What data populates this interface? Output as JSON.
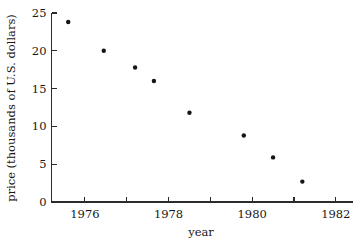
{
  "chart_data": {
    "type": "scatter",
    "title": "",
    "xlabel": "year",
    "ylabel": "price (thousands of U.S. dollars)",
    "xlim": [
      1975.2,
      1982.4
    ],
    "ylim": [
      0,
      25
    ],
    "grid": false,
    "legend": null,
    "marker": {
      "shape": "circle",
      "color": "#16161a",
      "size_px": 4.4
    },
    "xticks": [
      1976,
      1977,
      1978,
      1979,
      1980,
      1981,
      1982
    ],
    "xtick_labels": [
      "1976",
      "",
      "1978",
      "",
      "1980",
      "",
      "1982"
    ],
    "yticks": [
      0,
      5,
      10,
      15,
      20,
      25
    ],
    "ytick_labels": [
      "0",
      "5",
      "10",
      "15",
      "20",
      "25"
    ],
    "x": [
      1975.6,
      1976.45,
      1977.2,
      1977.65,
      1978.5,
      1979.8,
      1980.5,
      1981.2
    ],
    "values": [
      23.8,
      20.0,
      17.8,
      16.0,
      11.8,
      8.8,
      5.9,
      2.7
    ],
    "points": [
      {
        "year": 1975.6,
        "price": 23.8
      },
      {
        "year": 1976.45,
        "price": 20.0
      },
      {
        "year": 1977.2,
        "price": 17.8
      },
      {
        "year": 1977.65,
        "price": 16.0
      },
      {
        "year": 1978.5,
        "price": 11.8
      },
      {
        "year": 1979.8,
        "price": 8.8
      },
      {
        "year": 1980.5,
        "price": 5.9
      },
      {
        "year": 1981.2,
        "price": 2.7
      }
    ]
  }
}
